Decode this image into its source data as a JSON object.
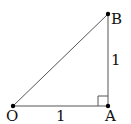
{
  "diagram": {
    "type": "right-triangle",
    "points": [
      {
        "id": "O",
        "label": "O",
        "x": 13,
        "y": 106
      },
      {
        "id": "A",
        "label": "A",
        "x": 108,
        "y": 106
      },
      {
        "id": "B",
        "label": "B",
        "x": 108,
        "y": 14
      }
    ],
    "segments": [
      {
        "from": "O",
        "to": "A",
        "length_label": "1"
      },
      {
        "from": "A",
        "to": "B",
        "length_label": "1"
      },
      {
        "from": "O",
        "to": "B",
        "length_label": ""
      }
    ],
    "right_angle_at": "A",
    "colors": {
      "line": "#555555",
      "point": "#000000",
      "text": "#111111"
    }
  }
}
